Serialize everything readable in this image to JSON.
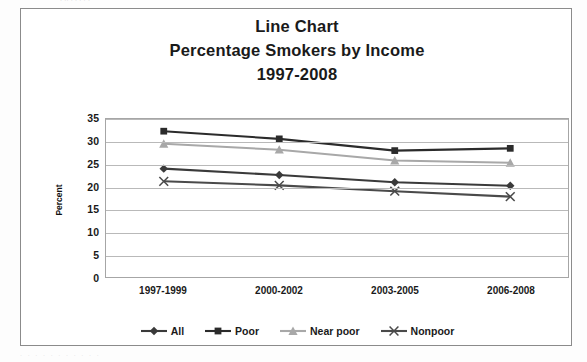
{
  "page": {
    "top_cut_text": "·  ·· ·            ·   ·           ·              ·",
    "bottom_cut_text": "·      ·      ·      ·      ·      ·      ·      ·      ·      ·      ·"
  },
  "chart_data": {
    "type": "line",
    "title": "Line Chart\nPercentage Smokers by Income\n1997-2008",
    "title_lines": [
      "Line Chart",
      "Percentage Smokers by Income",
      "1997-2008"
    ],
    "xlabel": "",
    "ylabel": "Percent",
    "ylim": [
      0,
      35
    ],
    "yticks": [
      0,
      5,
      10,
      15,
      20,
      25,
      30,
      35
    ],
    "ytick_labels": [
      "0",
      "5",
      "10",
      "15",
      "20",
      "25",
      "30",
      "35"
    ],
    "grid": true,
    "legend_position": "bottom",
    "categories": [
      "1997-1999",
      "2000-2002",
      "2003-2005",
      "2006-2008"
    ],
    "series": [
      {
        "name": "All",
        "marker": "diamond",
        "color": "#3a3a3a",
        "values": [
          24.0,
          22.6,
          21.0,
          20.2
        ]
      },
      {
        "name": "Poor",
        "marker": "square",
        "color": "#2b2b2b",
        "values": [
          32.3,
          30.6,
          28.0,
          28.5
        ]
      },
      {
        "name": "Near poor",
        "marker": "triangle",
        "color": "#a8a8a8",
        "values": [
          29.5,
          28.2,
          25.8,
          25.3
        ]
      },
      {
        "name": "Nonpoor",
        "marker": "x",
        "color": "#4a4a4a",
        "values": [
          21.2,
          20.3,
          19.0,
          17.8
        ]
      }
    ]
  },
  "legend": {
    "items": [
      {
        "label": "All",
        "marker": "diamond",
        "color": "#3a3a3a"
      },
      {
        "label": "Poor",
        "marker": "square",
        "color": "#2b2b2b"
      },
      {
        "label": "Near poor",
        "marker": "triangle",
        "color": "#a8a8a8"
      },
      {
        "label": "Nonpoor",
        "marker": "x",
        "color": "#4a4a4a"
      }
    ]
  }
}
